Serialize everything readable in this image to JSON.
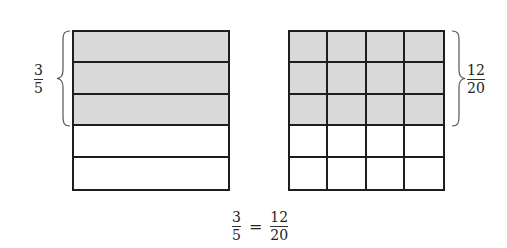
{
  "left_model": {
    "rows": 5,
    "cols": 1,
    "shaded_rows": 3,
    "label": {
      "numerator": "3",
      "denominator": "5"
    }
  },
  "right_model": {
    "rows": 5,
    "cols": 4,
    "shaded_rows": 3,
    "label": {
      "numerator": "12",
      "denominator": "20"
    }
  },
  "equation": {
    "left": {
      "numerator": "3",
      "denominator": "5"
    },
    "sign": "=",
    "right": {
      "numerator": "12",
      "denominator": "20"
    }
  },
  "colors": {
    "shade": "#d9d9d9",
    "line": "#1e1e1e"
  }
}
